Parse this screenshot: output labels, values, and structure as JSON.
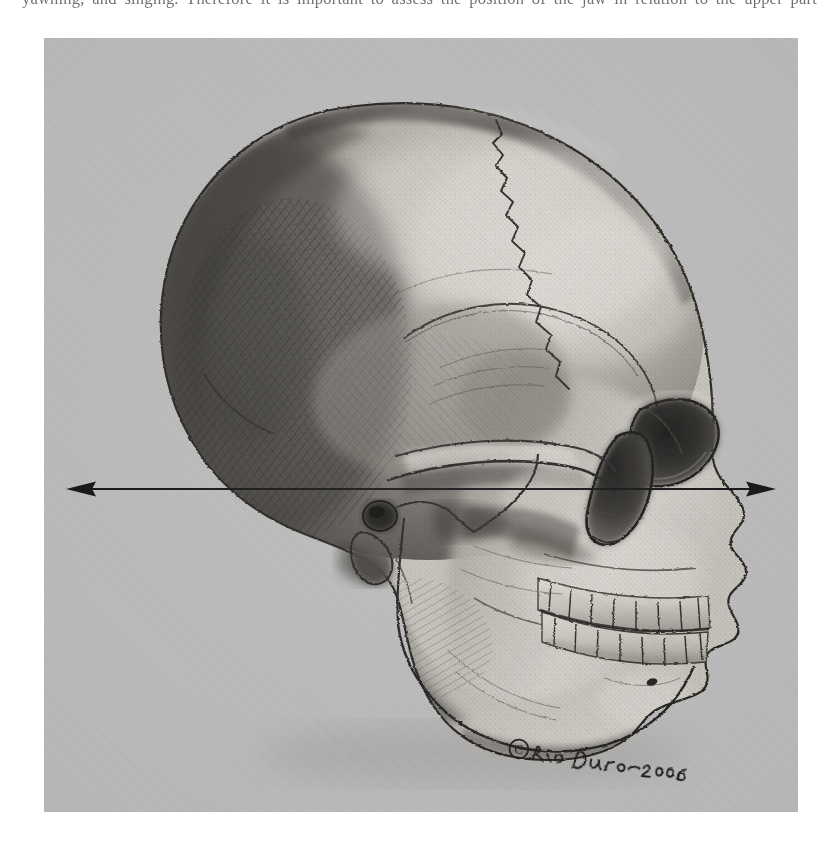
{
  "page": {
    "top_caption_fragment": "yawning, and singing. Therefore it is important to assess the position of the jaw in relation to the upper part"
  },
  "figure": {
    "panel_background_color": "#b9b9b9",
    "media": "graphite pencil drawing",
    "annotation_arrow": {
      "name": "frankfort-horizontal-plane-arrow",
      "style": "double-headed horizontal arrow",
      "color": "#121212",
      "y_fraction": 0.582,
      "x_start_fraction": 0.038,
      "x_end_fraction": 0.966,
      "shaft_thickness_px": 2.1,
      "head_length_px": 26,
      "head_width_px": 15
    },
    "signature": {
      "copyright_symbol": "©",
      "artist": "Rio Duro",
      "year": "2006",
      "text": "© Rio Duro 2006",
      "rendering": "handwritten cursive, graphite"
    },
    "anatomical_features": [
      "frontal bone",
      "coronal suture",
      "parietal bone",
      "squamous suture",
      "temporal bone",
      "occipital bone",
      "mastoid process",
      "external acoustic meatus",
      "zygomatic arch",
      "orbit (eye socket)",
      "nasal aperture",
      "maxilla with upper dentition",
      "mandible with lower dentition",
      "mental protuberance",
      "mandibular angle",
      "ramus of mandible",
      "condylar process",
      "coronoid process"
    ],
    "tooth_count_upper_visible": 8,
    "tooth_count_lower_visible": 8,
    "palette": {
      "paper": "#b9b9b9",
      "bone_highlight": "#d8d6d0",
      "bone_midtone": "#a09c95",
      "bone_shadow": "#5f5b57",
      "deep_shadow": "#2e2c2a",
      "outline": "#1d1b1a"
    }
  }
}
